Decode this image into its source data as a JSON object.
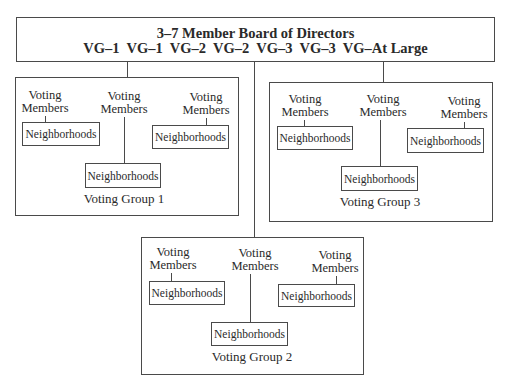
{
  "board": {
    "title": "3–7 Member Board of Directors",
    "seats_line": "VG–1  VG–1  VG–2  VG–2  VG–3  VG–3  VG–At Large"
  },
  "groups": [
    {
      "name": "Voting Group 1",
      "members": [
        {
          "label_line1": "Voting",
          "label_line2": "Members",
          "child": "Neighborhoods"
        },
        {
          "label_line1": "Voting",
          "label_line2": "Members",
          "child": "Neighborhoods"
        },
        {
          "label_line1": "Voting",
          "label_line2": "Members",
          "child": "Neighborhoods"
        }
      ]
    },
    {
      "name": "Voting Group 2",
      "members": [
        {
          "label_line1": "Voting",
          "label_line2": "Members",
          "child": "Neighborhoods"
        },
        {
          "label_line1": "Voting",
          "label_line2": "Members",
          "child": "Neighborhoods"
        },
        {
          "label_line1": "Voting",
          "label_line2": "Members",
          "child": "Neighborhoods"
        }
      ]
    },
    {
      "name": "Voting Group 3",
      "members": [
        {
          "label_line1": "Voting",
          "label_line2": "Members",
          "child": "Neighborhoods"
        },
        {
          "label_line1": "Voting",
          "label_line2": "Members",
          "child": "Neighborhoods"
        },
        {
          "label_line1": "Voting",
          "label_line2": "Members",
          "child": "Neighborhoods"
        }
      ]
    }
  ]
}
